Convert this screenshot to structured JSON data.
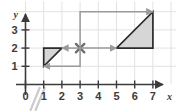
{
  "figure": {
    "title": "",
    "axis_labels": {
      "x": "x",
      "y": "y"
    },
    "x_ticks": [
      "0",
      "1",
      "2",
      "3",
      "4",
      "5",
      "6",
      "7"
    ],
    "y_ticks": [
      "1",
      "2",
      "3"
    ],
    "origin_label": "0",
    "colors": {
      "shape_fill": "#d6d6d6",
      "shape_stroke": "#2b2b2b",
      "arrow": "#9a9a9a",
      "grid": "#e2e2e2",
      "axis": "#3b3b3b",
      "break_mark": "#cccccc",
      "background": "#ffffff"
    },
    "center_marker": {
      "name": "center-of-dilation",
      "glyph": "x",
      "x": 3,
      "y": 2
    }
  },
  "chart_data": {
    "type": "scatter",
    "title": "",
    "xlabel": "x",
    "ylabel": "y",
    "xlim": [
      0,
      7.6
    ],
    "ylim": [
      0,
      4.4
    ],
    "grid": true,
    "x_tick_values": [
      0,
      1,
      2,
      3,
      4,
      5,
      6,
      7
    ],
    "y_tick_values": [
      1,
      2,
      3
    ],
    "x_tick_labels": [
      "0",
      "1",
      "2",
      "3",
      "4",
      "5",
      "6",
      "7"
    ],
    "y_tick_labels": [
      "1",
      "2",
      "3"
    ],
    "legend": null,
    "shapes": [
      {
        "name": "small-triangle",
        "kind": "polygon",
        "vertices": [
          [
            1,
            1
          ],
          [
            1,
            2
          ],
          [
            2,
            2
          ]
        ],
        "fill": "#d6d6d6",
        "stroke": "#2b2b2b"
      },
      {
        "name": "large-triangle",
        "kind": "polygon",
        "vertices": [
          [
            5,
            2
          ],
          [
            7,
            2
          ],
          [
            7,
            4
          ]
        ],
        "fill": "#d6d6d6",
        "stroke": "#2b2b2b"
      }
    ],
    "annotations": [
      {
        "name": "center-marker",
        "kind": "x-marker",
        "at": [
          3,
          2
        ],
        "color": "#6e6e6e"
      },
      {
        "name": "arrow-to-small-top-vertex",
        "kind": "arrow",
        "path": [
          [
            3,
            2
          ],
          [
            2,
            2
          ]
        ],
        "color": "#9a9a9a"
      },
      {
        "name": "arrow-to-small-bottom-vertex",
        "kind": "arrow",
        "path": [
          [
            3,
            2
          ],
          [
            3,
            1
          ],
          [
            1,
            1
          ]
        ],
        "color": "#9a9a9a"
      },
      {
        "name": "arrow-to-large-left-vertex",
        "kind": "arrow",
        "path": [
          [
            3,
            2
          ],
          [
            5,
            2
          ]
        ],
        "color": "#9a9a9a"
      },
      {
        "name": "arrow-to-large-top-vertex",
        "kind": "arrow",
        "path": [
          [
            3,
            2
          ],
          [
            3,
            4
          ],
          [
            7,
            4
          ]
        ],
        "color": "#9a9a9a"
      }
    ],
    "axis_break_marks": {
      "name": "axis-break",
      "at_x": 0.5,
      "count": 2
    }
  }
}
